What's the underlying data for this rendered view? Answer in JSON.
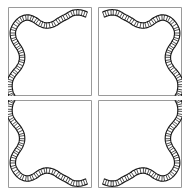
{
  "figure": {
    "canvas": {
      "width": 192,
      "height": 195,
      "background_color": "#ffffff"
    },
    "layout": {
      "rows": 2,
      "columns": 2,
      "tile_count": 4,
      "tile_width": 84,
      "tile_height": 89,
      "gap_x": 6,
      "gap_y": 4,
      "origin_x": 8,
      "origin_y": 7
    },
    "frame": {
      "stroke_color": "#9a9a9a",
      "stroke_width": 1,
      "fill_color": "#ffffff"
    },
    "ribbon": {
      "style": "ladder-hatched band",
      "edge_color": "#1a1a1a",
      "edge_width": 1.15,
      "rung_color": "#1a1a1a",
      "rung_width": 0.75,
      "rung_count": 62,
      "band_thickness": 5.4,
      "interior_fill": "#ffffff"
    },
    "tiles": [
      {
        "name": "top-left",
        "transform": "none",
        "x": 8,
        "y": 7
      },
      {
        "name": "top-right",
        "transform": "mirror-x",
        "x": 98,
        "y": 7
      },
      {
        "name": "bottom-left",
        "transform": "mirror-y",
        "x": 8,
        "y": 100
      },
      {
        "name": "bottom-right",
        "transform": "mirror-xy",
        "x": 98,
        "y": 100
      }
    ],
    "motif_path": "M 86,14 C 74,10 62,15 54,20 C 46,25 38,26 31,21 C 23,15 14,19 11,28 C 8,37 13,44 17,50 C 22,57 21,65 15,71 C 8,78 8,86 11,89"
  }
}
